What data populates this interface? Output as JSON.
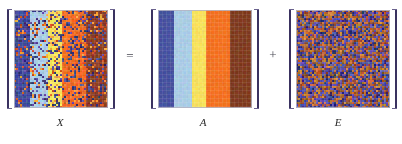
{
  "figure": {
    "type": "matrix-decomposition-equation",
    "background_color": "#ffffff",
    "bracket_color": "#3a3260",
    "operators": [
      {
        "id": "equals",
        "symbol": "=",
        "x": 122,
        "y": 49
      },
      {
        "id": "plus",
        "symbol": "+",
        "x": 265,
        "y": 48
      }
    ],
    "matrices": [
      {
        "id": "X",
        "label": "X",
        "label_x": 40,
        "x": 14,
        "left_bracket_x": 6,
        "right_bracket_x": 110,
        "label_style": "italic-serif",
        "render": "noisy-bands",
        "noise_amount": 0.62,
        "cell_size": 2,
        "bands": [
          {
            "color": "#3f4a9c",
            "width_frac": 0.16
          },
          {
            "color": "#a8cbe4",
            "width_frac": 0.2
          },
          {
            "color": "#f6e05a",
            "width_frac": 0.16
          },
          {
            "color": "#f26a21",
            "width_frac": 0.25
          },
          {
            "color": "#8a3a22",
            "width_frac": 0.23
          }
        ],
        "noise_palette": [
          "#3b3a80",
          "#5a4fa0",
          "#2e2f6e",
          "#d4541f",
          "#f0a03a"
        ]
      },
      {
        "id": "A",
        "label": "A",
        "label_x": 183,
        "x": 158,
        "left_bracket_x": 150,
        "right_bracket_x": 254,
        "label_style": "italic-serif",
        "render": "clean-bands",
        "noise_amount": 0.07,
        "cell_size": 2,
        "bands": [
          {
            "color": "#45509e",
            "width_frac": 0.16
          },
          {
            "color": "#a8cbe4",
            "width_frac": 0.2
          },
          {
            "color": "#f6e05a",
            "width_frac": 0.16
          },
          {
            "color": "#f2701f",
            "width_frac": 0.25
          },
          {
            "color": "#7e3a1e",
            "width_frac": 0.23
          }
        ],
        "noise_palette": []
      },
      {
        "id": "E",
        "label": "E",
        "label_x": 318,
        "x": 296,
        "left_bracket_x": 288,
        "right_bracket_x": 392,
        "label_style": "italic-serif",
        "render": "uniform-noise",
        "noise_amount": 1.0,
        "cell_size": 2,
        "base_color": "#3b3a8c",
        "bands": [
          {
            "color": "#3b3a8c",
            "width_frac": 1.0
          }
        ],
        "noise_palette": [
          "#2e2d72",
          "#4a47a5",
          "#5d55b0",
          "#8a4a2e",
          "#b5612a",
          "#c97a35"
        ]
      }
    ]
  }
}
